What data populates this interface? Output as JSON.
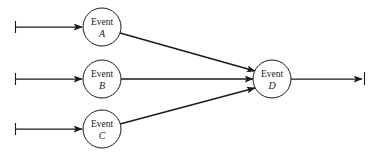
{
  "diagram": {
    "type": "event-network",
    "title": "",
    "background_color": "#ffffff",
    "line_color": "#1a1a1a",
    "nodes": [
      {
        "id": "A",
        "label_top": "Event",
        "label_id": "A",
        "cx": 102,
        "cy": 27,
        "r": 19,
        "name": "node-event-a"
      },
      {
        "id": "B",
        "label_top": "Event",
        "label_id": "B",
        "cx": 102,
        "cy": 79,
        "r": 19,
        "name": "node-event-b"
      },
      {
        "id": "C",
        "label_top": "Event",
        "label_id": "C",
        "cx": 102,
        "cy": 129,
        "r": 19,
        "name": "node-event-c"
      },
      {
        "id": "D",
        "label_top": "Event",
        "label_id": "D",
        "cx": 272,
        "cy": 79,
        "r": 19,
        "name": "node-event-d"
      }
    ],
    "edges": [
      {
        "from": "input-1",
        "to": "A",
        "name": "edge-input-to-a",
        "arrowhead": "at-end",
        "tail_tick": true
      },
      {
        "from": "input-2",
        "to": "B",
        "name": "edge-input-to-b",
        "arrowhead": "at-end",
        "tail_tick": true
      },
      {
        "from": "input-3",
        "to": "C",
        "name": "edge-input-to-c",
        "arrowhead": "at-end",
        "tail_tick": true
      },
      {
        "from": "A",
        "to": "D",
        "name": "edge-a-to-d",
        "arrowhead": "at-end",
        "tail_tick": false
      },
      {
        "from": "B",
        "to": "D",
        "name": "edge-b-to-d",
        "arrowhead": "at-end",
        "tail_tick": false
      },
      {
        "from": "C",
        "to": "D",
        "name": "edge-c-to-d",
        "arrowhead": "at-end",
        "tail_tick": false
      },
      {
        "from": "D",
        "to": "output-1",
        "name": "edge-d-to-output",
        "arrowhead": "at-end",
        "tail_tick": true
      }
    ]
  }
}
